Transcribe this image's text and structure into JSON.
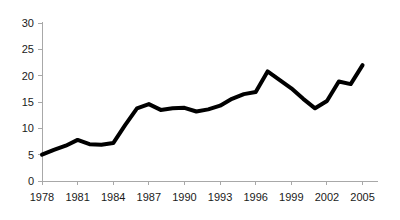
{
  "chart_data": {
    "type": "line",
    "title": "",
    "subtitle": "",
    "xlabel": "",
    "ylabel": "",
    "xlim": [
      1978,
      2005
    ],
    "ylim": [
      0,
      30
    ],
    "grid": false,
    "legend": null,
    "legend_position": "none",
    "line_color": "#000000",
    "axis_color": "#a8a8a8",
    "background_color": "#ffffff",
    "y_ticks": [
      "0",
      "5",
      "10",
      "15",
      "20",
      "25",
      "30"
    ],
    "y_tick_values": [
      0,
      5,
      10,
      15,
      20,
      25,
      30
    ],
    "x_ticks": [
      "1978",
      "1981",
      "1984",
      "1987",
      "1990",
      "1993",
      "1996",
      "1999",
      "2002",
      "2005"
    ],
    "x_tick_values": [
      1978,
      1981,
      1984,
      1987,
      1990,
      1993,
      1996,
      1999,
      2002,
      2005
    ],
    "x": [
      1978,
      1979,
      1980,
      1981,
      1982,
      1983,
      1984,
      1985,
      1986,
      1987,
      1988,
      1989,
      1990,
      1991,
      1992,
      1993,
      1994,
      1995,
      1996,
      1997,
      1998,
      1999,
      2000,
      2001,
      2002,
      2003,
      2004,
      2005
    ],
    "values": [
      5.0,
      5.9,
      6.7,
      7.8,
      7.0,
      6.9,
      7.2,
      10.6,
      13.8,
      14.6,
      13.5,
      13.8,
      13.9,
      13.2,
      13.6,
      14.3,
      15.6,
      16.5,
      16.9,
      20.8,
      19.2,
      17.6,
      15.6,
      13.8,
      15.2,
      18.9,
      18.4,
      22.0
    ],
    "series": [
      {
        "name": "series-1",
        "color": "#000000",
        "values": [
          5.0,
          5.9,
          6.7,
          7.8,
          7.0,
          6.9,
          7.2,
          10.6,
          13.8,
          14.6,
          13.5,
          13.8,
          13.9,
          13.2,
          13.6,
          14.3,
          15.6,
          16.5,
          16.9,
          20.8,
          19.2,
          17.6,
          15.6,
          13.8,
          15.2,
          18.9,
          18.4,
          22.0
        ]
      }
    ],
    "annotations": []
  }
}
